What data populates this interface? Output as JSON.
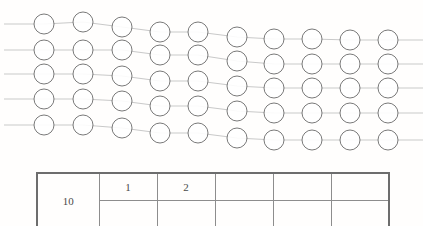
{
  "page": {
    "background_color": "#fffefd",
    "top_text_sliver": "                  "
  },
  "figure": {
    "name": "beads-on-strings-diagram",
    "circle_color": "#6a6a6a",
    "string_color": "#c9c9c9",
    "circle_radius": 10,
    "row_count": 5,
    "rows": [
      {
        "index": 0,
        "line": {
          "x1": 4,
          "y1": 18,
          "x2": 423,
          "y2": 46
        },
        "circles_x": [
          44,
          83,
          122,
          160,
          198,
          237,
          274,
          312,
          350,
          388
        ],
        "circles_y": [
          18,
          16,
          21,
          26,
          26,
          31,
          33,
          33,
          34,
          34
        ]
      },
      {
        "index": 1,
        "line": {
          "x1": 4,
          "y1": 44,
          "x2": 423,
          "y2": 70
        },
        "circles_x": [
          44,
          83,
          122,
          160,
          198,
          237,
          274,
          312,
          350,
          388
        ],
        "circles_y": [
          44,
          44,
          44,
          49,
          49,
          55,
          58,
          58,
          58,
          58
        ]
      },
      {
        "index": 2,
        "line": {
          "x1": 4,
          "y1": 68,
          "x2": 423,
          "y2": 94
        },
        "circles_x": [
          44,
          83,
          122,
          160,
          198,
          237,
          274,
          312,
          350,
          388
        ],
        "circles_y": [
          68,
          68,
          70,
          75,
          75,
          80,
          82,
          82,
          82,
          82
        ]
      },
      {
        "index": 3,
        "line": {
          "x1": 4,
          "y1": 93,
          "x2": 423,
          "y2": 119
        },
        "circles_x": [
          44,
          83,
          122,
          160,
          198,
          237,
          274,
          312,
          350,
          388
        ],
        "circles_y": [
          93,
          93,
          95,
          100,
          100,
          105,
          107,
          107,
          107,
          107
        ]
      },
      {
        "index": 4,
        "line": {
          "x1": 4,
          "y1": 119,
          "x2": 423,
          "y2": 146
        },
        "circles_x": [
          44,
          83,
          122,
          160,
          198,
          237,
          274,
          312,
          350,
          388
        ],
        "circles_y": [
          119,
          119,
          122,
          127,
          127,
          132,
          134,
          134,
          134,
          134
        ]
      }
    ]
  },
  "table": {
    "name": "data-grid",
    "column_count": 6,
    "row_count": 2,
    "border_color": "#8d8d8d",
    "outer_border_color": "#6d6d6d",
    "cells": {
      "r0c0": "10",
      "r0c1": "1",
      "r0c2": "2",
      "r0c3": "",
      "r0c4": "",
      "r0c5": "",
      "r1c1": "",
      "r1c2": "",
      "r1c3": "",
      "r1c4": "",
      "r1c5": ""
    }
  }
}
